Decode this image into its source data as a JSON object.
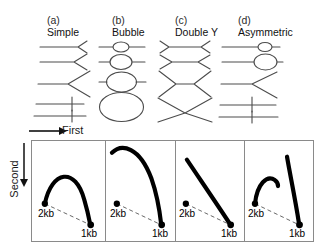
{
  "figure": {
    "columns": [
      {
        "letter": "(a)",
        "title": "Simple",
        "shape_kind": "simple-y"
      },
      {
        "letter": "(b)",
        "title": "Bubble",
        "shape_kind": "bubble"
      },
      {
        "letter": "(c)",
        "title": "Double Y",
        "shape_kind": "double-y"
      },
      {
        "letter": "(d)",
        "title": "Asymmetric",
        "shape_kind": "asymmetric"
      }
    ],
    "axes": {
      "first_dimension_label": "First",
      "second_dimension_label": "Second",
      "first_arrow_direction": "right",
      "second_arrow_direction": "down"
    },
    "gel_panels": [
      {
        "panel_letter": "(a)",
        "pattern_name": "Simple",
        "arc_type": "complete-y-arc",
        "start_label": "2kb",
        "end_label": "1kb",
        "arc_count": 1,
        "notes": "Smooth arc rising from the 2kb linear spot, peaking near mid-panel, returning to the 1kb spot"
      },
      {
        "panel_letter": "(b)",
        "pattern_name": "Bubble",
        "arc_type": "high-bubble-arc",
        "start_label": "2kb",
        "end_label": "1kb",
        "arc_count": 1,
        "notes": "Arc ascends steeply to the upper-left region then descends sharply to the 1kb spot; does not join the 2kb spot"
      },
      {
        "panel_letter": "(c)",
        "pattern_name": "Double Y",
        "arc_type": "straight-diagonal",
        "start_label": "2kb",
        "end_label": "1kb",
        "arc_count": 1,
        "notes": "Nearly straight steep line from upper-left down to the 1kb spot"
      },
      {
        "panel_letter": "(d)",
        "pattern_name": "Asymmetric",
        "arc_type": "two-discontinuous-arcs",
        "start_label": "2kb",
        "end_label": "1kb",
        "arc_count": 2,
        "notes": "A short arc leaving the 2kb spot that terminates abruptly, plus a separate tall arc descending to the 1kb spot"
      }
    ],
    "labels": {
      "two_kb": "2kb",
      "one_kb": "1kb"
    },
    "colors": {
      "arc": "#000000",
      "schematic_line": "#4c4c4c",
      "panel_border": "#8a8a8a",
      "dashed_diagonal": "#555555",
      "background": "#ffffff",
      "text": "#111111"
    }
  }
}
